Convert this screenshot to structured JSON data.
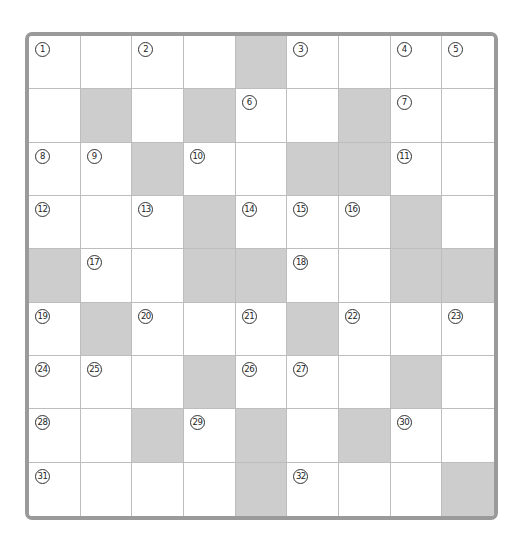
{
  "puzzle": {
    "type": "crossword",
    "rows": 9,
    "cols": 9,
    "colors": {
      "block": "#cdcdcd",
      "cell": "#ffffff",
      "border": "#9a9a9a",
      "gridline": "#bdbdbd"
    },
    "grid": [
      [
        {
          "n": "1"
        },
        {
          "n": ""
        },
        {
          "n": "2"
        },
        {
          "n": ""
        },
        {
          "b": true
        },
        {
          "n": "3"
        },
        {
          "n": ""
        },
        {
          "n": "4"
        },
        {
          "n": "5"
        }
      ],
      [
        {
          "n": ""
        },
        {
          "b": true
        },
        {
          "n": ""
        },
        {
          "b": true
        },
        {
          "n": "6"
        },
        {
          "n": ""
        },
        {
          "b": true
        },
        {
          "n": "7"
        },
        {
          "n": ""
        }
      ],
      [
        {
          "n": "8"
        },
        {
          "n": "9"
        },
        {
          "b": true
        },
        {
          "n": "10"
        },
        {
          "n": ""
        },
        {
          "b": true
        },
        {
          "b": true
        },
        {
          "n": "11"
        },
        {
          "n": ""
        }
      ],
      [
        {
          "n": "12"
        },
        {
          "n": ""
        },
        {
          "n": "13"
        },
        {
          "b": true
        },
        {
          "n": "14"
        },
        {
          "n": "15"
        },
        {
          "n": "16"
        },
        {
          "b": true
        },
        {
          "n": ""
        }
      ],
      [
        {
          "b": true
        },
        {
          "n": "17"
        },
        {
          "n": ""
        },
        {
          "b": true
        },
        {
          "b": true
        },
        {
          "n": "18"
        },
        {
          "n": ""
        },
        {
          "b": true
        },
        {
          "b": true
        }
      ],
      [
        {
          "n": "19"
        },
        {
          "b": true
        },
        {
          "n": "20"
        },
        {
          "n": ""
        },
        {
          "n": "21"
        },
        {
          "b": true
        },
        {
          "n": "22"
        },
        {
          "n": ""
        },
        {
          "n": "23"
        }
      ],
      [
        {
          "n": "24"
        },
        {
          "n": "25"
        },
        {
          "n": ""
        },
        {
          "b": true
        },
        {
          "n": "26"
        },
        {
          "n": "27"
        },
        {
          "n": ""
        },
        {
          "b": true
        },
        {
          "n": ""
        }
      ],
      [
        {
          "n": "28"
        },
        {
          "n": ""
        },
        {
          "b": true
        },
        {
          "n": "29"
        },
        {
          "b": true
        },
        {
          "n": ""
        },
        {
          "b": true
        },
        {
          "n": "30"
        },
        {
          "n": ""
        }
      ],
      [
        {
          "n": "31"
        },
        {
          "n": ""
        },
        {
          "n": ""
        },
        {
          "n": ""
        },
        {
          "b": true
        },
        {
          "n": "32"
        },
        {
          "n": ""
        },
        {
          "n": ""
        },
        {
          "b": true
        }
      ]
    ]
  }
}
